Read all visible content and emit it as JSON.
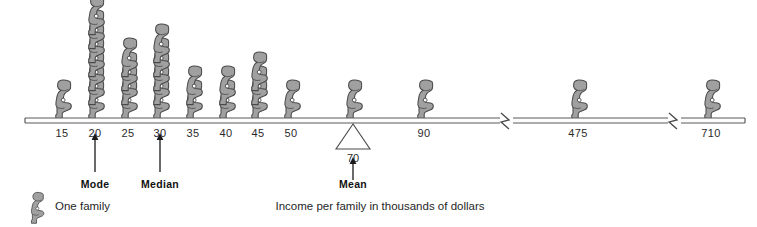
{
  "chart_data": {
    "type": "bar",
    "title": "",
    "subtitle": "",
    "xlabel": "Income per family in thousands of dollars",
    "ylabel": "",
    "unit_label": "One family",
    "grid": false,
    "legend_position": "bottom-left",
    "axis_note": "Axis has two scale breaks: between 90 and 475, and between 475 and 710",
    "categories": [
      "15",
      "20",
      "25",
      "30",
      "35",
      "40",
      "45",
      "50",
      "70",
      "90",
      "475",
      "710"
    ],
    "values": [
      1,
      7,
      4,
      5,
      2,
      2,
      3,
      1,
      1,
      1,
      1,
      1
    ],
    "value_meaning": "number of families (pictogram figures) at each income level",
    "xlim": [
      10,
      730
    ],
    "ylim": [
      0,
      7
    ],
    "annotations": [
      {
        "label": "Mode",
        "at_category": "20",
        "value": 20,
        "arrow": "up"
      },
      {
        "label": "Median",
        "at_category": "30",
        "value": 30,
        "arrow": "up"
      },
      {
        "label": "Mean",
        "at_category": "70",
        "value": 70,
        "arrow": "up",
        "marker": "fulcrum-triangle"
      }
    ],
    "tick_labels": [
      "15",
      "20",
      "25",
      "30",
      "35",
      "40",
      "45",
      "50",
      "90",
      "475",
      "710"
    ],
    "fulcrum_label": "70"
  },
  "axis": {
    "ticks": [
      {
        "label": "15",
        "x": 62,
        "count": 1
      },
      {
        "label": "20",
        "x": 95,
        "count": 7
      },
      {
        "label": "25",
        "x": 128,
        "count": 4
      },
      {
        "label": "30",
        "x": 160,
        "count": 5
      },
      {
        "label": "35",
        "x": 193,
        "count": 2
      },
      {
        "label": "40",
        "x": 226,
        "count": 2
      },
      {
        "label": "45",
        "x": 258,
        "count": 3
      },
      {
        "label": "50",
        "x": 291,
        "count": 1
      },
      {
        "label": "90",
        "x": 424,
        "count": 1
      },
      {
        "label": "475",
        "x": 578,
        "count": 1
      },
      {
        "label": "710",
        "x": 711,
        "count": 1
      }
    ],
    "fulcrum": {
      "label": "70",
      "x": 353,
      "count": 1
    }
  },
  "markers": [
    {
      "name": "mode",
      "label": "Mode",
      "x": 95
    },
    {
      "name": "median",
      "label": "Median",
      "x": 160
    },
    {
      "name": "mean",
      "label": "Mean",
      "x": 353
    }
  ],
  "legend": {
    "label": "One family"
  },
  "caption": {
    "text": "Income per family in thousands of dollars",
    "x": 380
  },
  "colors": {
    "figure_fill": "#9e9e9e",
    "figure_stroke": "#4a4a4a",
    "axis_line": "#555555",
    "text": "#1f1f1f",
    "background": "#ffffff"
  }
}
